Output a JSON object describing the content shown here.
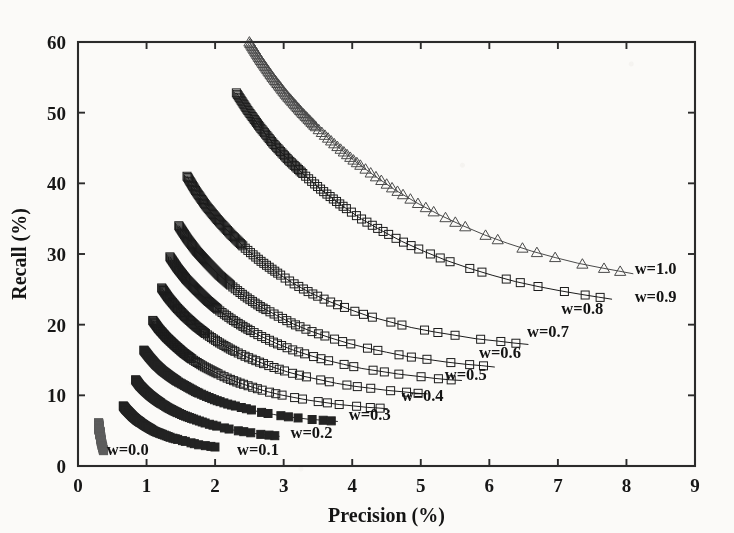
{
  "figure": {
    "background_color": "#fbfaf8",
    "ink_color": "#2b2b2b",
    "plot_box": {
      "left": 78,
      "right": 695,
      "top": 42,
      "bottom": 466
    }
  },
  "chart_data": {
    "type": "line",
    "title": "",
    "xlabel": "Precision (%)",
    "ylabel": "Recall (%)",
    "xlim": [
      0,
      9
    ],
    "ylim": [
      0,
      60
    ],
    "xticks": [
      0,
      1,
      2,
      3,
      4,
      5,
      6,
      7,
      8,
      9
    ],
    "yticks": [
      0,
      10,
      20,
      30,
      40,
      50,
      60
    ],
    "xticklabels": [
      "0",
      "1",
      "2",
      "3",
      "4",
      "5",
      "6",
      "7",
      "8",
      "9"
    ],
    "yticklabels": [
      "0",
      "10",
      "20",
      "30",
      "40",
      "50",
      "60"
    ],
    "grid": false,
    "legend": "inline-annotations",
    "box": true,
    "tick_direction": "in",
    "series": [
      {
        "name": "w=0.0",
        "label": "w=0.0",
        "marker": "square",
        "marker_filled": true,
        "color": "#5d5d5d",
        "label_xy": [
          0.42,
          1.6
        ],
        "x": [
          0.3,
          0.3,
          0.31,
          0.31,
          0.32,
          0.32,
          0.33,
          0.33,
          0.34,
          0.34,
          0.35,
          0.35,
          0.36,
          0.36,
          0.37,
          0.37,
          0.38
        ],
        "y": [
          6.1,
          5.8,
          5.4,
          5.1,
          4.8,
          4.5,
          4.2,
          3.9,
          3.6,
          3.4,
          3.1,
          2.9,
          2.7,
          2.5,
          2.3,
          2.2,
          2.1
        ]
      },
      {
        "name": "w=0.1",
        "label": "w=0.1",
        "marker": "square",
        "marker_filled": true,
        "color": "#232323",
        "label_xy": [
          2.32,
          1.6
        ],
        "x": [
          0.66,
          0.7,
          0.75,
          0.8,
          0.86,
          0.92,
          0.98,
          1.05,
          1.12,
          1.2,
          1.28,
          1.36,
          1.44,
          1.52,
          1.6,
          1.68,
          1.76,
          1.84,
          1.92,
          1.99,
          2.05
        ],
        "y": [
          8.5,
          8.0,
          7.5,
          7.0,
          6.5,
          6.1,
          5.7,
          5.3,
          4.9,
          4.6,
          4.3,
          4.0,
          3.8,
          3.6,
          3.4,
          3.2,
          3.0,
          2.9,
          2.8,
          2.7,
          2.6
        ]
      },
      {
        "name": "w=0.2",
        "label": "w=0.2",
        "marker": "square",
        "marker_filled": true,
        "color": "#232323",
        "label_xy": [
          3.1,
          4.0
        ],
        "x": [
          0.84,
          0.9,
          0.97,
          1.05,
          1.13,
          1.22,
          1.32,
          1.42,
          1.53,
          1.64,
          1.76,
          1.88,
          2.0,
          2.13,
          2.26,
          2.39,
          2.52,
          2.64,
          2.76,
          2.86,
          2.94
        ],
        "y": [
          12.2,
          11.4,
          10.7,
          10.0,
          9.4,
          8.8,
          8.2,
          7.7,
          7.2,
          6.8,
          6.4,
          6.0,
          5.7,
          5.4,
          5.1,
          4.9,
          4.7,
          4.5,
          4.4,
          4.3,
          4.2
        ]
      },
      {
        "name": "w=0.3",
        "label": "w=0.3",
        "marker": "square",
        "marker_filled": true,
        "color": "#232323",
        "label_xy": [
          3.95,
          6.5
        ],
        "x": [
          0.96,
          1.04,
          1.13,
          1.23,
          1.34,
          1.46,
          1.59,
          1.72,
          1.86,
          2.01,
          2.17,
          2.33,
          2.5,
          2.67,
          2.85,
          3.03,
          3.21,
          3.38,
          3.54,
          3.68,
          3.79
        ],
        "y": [
          16.4,
          15.4,
          14.4,
          13.5,
          12.7,
          11.9,
          11.2,
          10.5,
          9.9,
          9.3,
          8.8,
          8.4,
          8.0,
          7.6,
          7.3,
          7.0,
          6.8,
          6.6,
          6.5,
          6.4,
          6.3
        ]
      },
      {
        "name": "w=0.4",
        "label": "w=0.4",
        "marker": "square",
        "marker_filled": false,
        "color": "#1c1c1c",
        "label_xy": [
          4.72,
          9.2
        ],
        "x": [
          1.09,
          1.18,
          1.29,
          1.41,
          1.54,
          1.68,
          1.83,
          1.99,
          2.16,
          2.34,
          2.53,
          2.73,
          2.94,
          3.15,
          3.37,
          3.59,
          3.81,
          4.02,
          4.22,
          4.39,
          4.52
        ],
        "y": [
          20.6,
          19.4,
          18.2,
          17.1,
          16.0,
          15.0,
          14.1,
          13.3,
          12.5,
          11.8,
          11.2,
          10.6,
          10.1,
          9.7,
          9.3,
          9.0,
          8.7,
          8.5,
          8.3,
          8.2,
          8.1
        ]
      },
      {
        "name": "w=0.5",
        "label": "w=0.5",
        "marker": "square",
        "marker_filled": false,
        "color": "#1c1c1c",
        "label_xy": [
          5.35,
          12.1
        ],
        "x": [
          1.22,
          1.32,
          1.44,
          1.57,
          1.72,
          1.88,
          2.05,
          2.23,
          2.42,
          2.62,
          2.84,
          3.06,
          3.29,
          3.53,
          3.77,
          4.02,
          4.27,
          4.51,
          4.74,
          4.94,
          5.1
        ],
        "y": [
          25.2,
          23.8,
          22.4,
          21.1,
          19.8,
          18.6,
          17.5,
          16.5,
          15.6,
          14.8,
          14.0,
          13.3,
          12.7,
          12.2,
          11.7,
          11.3,
          11.0,
          10.7,
          10.5,
          10.3,
          10.2
        ]
      },
      {
        "name": "w=0.6",
        "label": "w=0.6",
        "marker": "square",
        "marker_filled": false,
        "color": "#1c1c1c",
        "label_xy": [
          5.85,
          15.3
        ],
        "x": [
          1.34,
          1.45,
          1.58,
          1.73,
          1.89,
          2.06,
          2.25,
          2.45,
          2.66,
          2.88,
          3.11,
          3.36,
          3.61,
          3.87,
          4.14,
          4.41,
          4.68,
          4.95,
          5.2,
          5.42,
          5.6
        ],
        "y": [
          29.6,
          28.0,
          26.4,
          24.9,
          23.4,
          22.0,
          20.7,
          19.5,
          18.4,
          17.4,
          16.5,
          15.7,
          15.0,
          14.4,
          13.8,
          13.4,
          13.0,
          12.7,
          12.4,
          12.2,
          12.1
        ]
      },
      {
        "name": "w=0.7",
        "label": "w=0.7",
        "marker": "square",
        "marker_filled": false,
        "color": "#1c1c1c",
        "label_xy": [
          6.55,
          18.3
        ],
        "x": [
          1.47,
          1.59,
          1.73,
          1.89,
          2.06,
          2.25,
          2.45,
          2.67,
          2.9,
          3.14,
          3.39,
          3.66,
          3.93,
          4.21,
          4.5,
          4.8,
          5.09,
          5.38,
          5.65,
          5.89,
          6.08
        ],
        "y": [
          34.0,
          32.2,
          30.4,
          28.7,
          27.0,
          25.4,
          23.9,
          22.5,
          21.3,
          20.1,
          19.1,
          18.2,
          17.4,
          16.7,
          16.1,
          15.5,
          15.1,
          14.7,
          14.4,
          14.2,
          14.0
        ]
      },
      {
        "name": "w=0.8",
        "label": "w=0.8",
        "marker": "square",
        "marker_filled": false,
        "color": "#1c1c1c",
        "label_xy": [
          7.05,
          21.5
        ],
        "x": [
          1.59,
          1.72,
          1.87,
          2.04,
          2.23,
          2.43,
          2.65,
          2.88,
          3.13,
          3.39,
          3.66,
          3.95,
          4.24,
          4.55,
          4.86,
          5.18,
          5.5,
          5.81,
          6.1,
          6.36,
          6.57
        ],
        "y": [
          41.0,
          38.9,
          36.8,
          34.8,
          32.8,
          30.9,
          29.1,
          27.5,
          25.9,
          24.5,
          23.3,
          22.2,
          21.2,
          20.4,
          19.6,
          19.0,
          18.5,
          18.0,
          17.7,
          17.4,
          17.2
        ]
      },
      {
        "name": "w=0.9",
        "label": "w=0.9",
        "marker": "square",
        "marker_filled": false,
        "color": "#1c1c1c",
        "label_xy": [
          8.12,
          23.2
        ],
        "x": [
          2.31,
          2.47,
          2.65,
          2.85,
          3.07,
          3.31,
          3.56,
          3.83,
          4.11,
          4.41,
          4.72,
          5.04,
          5.37,
          5.7,
          6.04,
          6.38,
          6.71,
          7.03,
          7.33,
          7.59,
          7.79
        ],
        "y": [
          52.8,
          50.4,
          48.0,
          45.6,
          43.3,
          41.1,
          39.0,
          37.0,
          35.1,
          33.4,
          31.8,
          30.4,
          29.1,
          28.0,
          27.0,
          26.1,
          25.4,
          24.8,
          24.3,
          23.9,
          23.6
        ]
      },
      {
        "name": "w=1.0",
        "label": "w=1.0",
        "marker": "triangle",
        "marker_filled": false,
        "color": "#4a4a4a",
        "label_xy": [
          8.12,
          27.2
        ],
        "x": [
          2.5,
          2.66,
          2.84,
          3.04,
          3.26,
          3.5,
          3.76,
          4.03,
          4.32,
          4.62,
          4.93,
          5.26,
          5.59,
          5.93,
          6.27,
          6.62,
          6.96,
          7.29,
          7.6,
          7.88,
          8.1
        ],
        "y": [
          60.0,
          57.5,
          55.0,
          52.5,
          50.1,
          47.7,
          45.4,
          43.2,
          41.1,
          39.1,
          37.3,
          35.6,
          34.1,
          32.7,
          31.5,
          30.4,
          29.5,
          28.7,
          28.1,
          27.6,
          27.2
        ]
      }
    ]
  }
}
